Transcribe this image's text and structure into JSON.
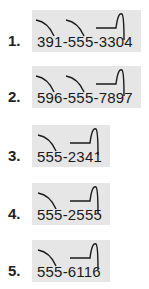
{
  "items": [
    {
      "number": "1.",
      "phone": "391-555-3304",
      "marks": [
        "curve",
        "curve",
        "rise"
      ]
    },
    {
      "number": "2.",
      "phone": "596-555-7897",
      "marks": [
        "curve",
        "curve",
        "rise"
      ]
    },
    {
      "number": "3.",
      "phone": "555-2341",
      "marks": [
        "curve",
        "rise"
      ]
    },
    {
      "number": "4.",
      "phone": "555-2555",
      "marks": [
        "curve",
        "rise"
      ]
    },
    {
      "number": "5.",
      "phone": "555-6116",
      "marks": [
        "curve",
        "rise"
      ]
    }
  ],
  "colors": {
    "box": "#e6e6e6",
    "ink": "#1a1a1a"
  }
}
